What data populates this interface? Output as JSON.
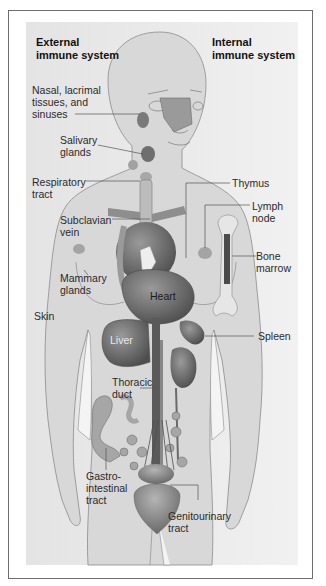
{
  "headings": {
    "external": "External\nimmune system",
    "internal": "Internal\nimmune system"
  },
  "labels": {
    "nasal": "Nasal, lacrimal\ntissues, and\nsinuses",
    "salivary": "Salivary\nglands",
    "respiratory": "Respiratory\ntract",
    "subclavian": "Subclavian\nvein",
    "mammary": "Mammary\nglands",
    "skin": "Skin",
    "thymus": "Thymus",
    "lymph_node": "Lymph\nnode",
    "bone_marrow": "Bone\nmarrow",
    "spleen": "Spleen",
    "thoracic": "Thoracic\nduct",
    "gastro": "Gastro-\nintestinal\ntract",
    "genitourinary": "Genitourinary\ntract"
  },
  "organ_labels": {
    "heart": "Heart",
    "liver": "Liver"
  },
  "colors": {
    "panel_bg": "#e8e8e8",
    "body_fill": "#d9d9d9",
    "organ_dark": "#5e5e5e",
    "organ_mid": "#8a8a8a",
    "leader_line": "#555555"
  }
}
